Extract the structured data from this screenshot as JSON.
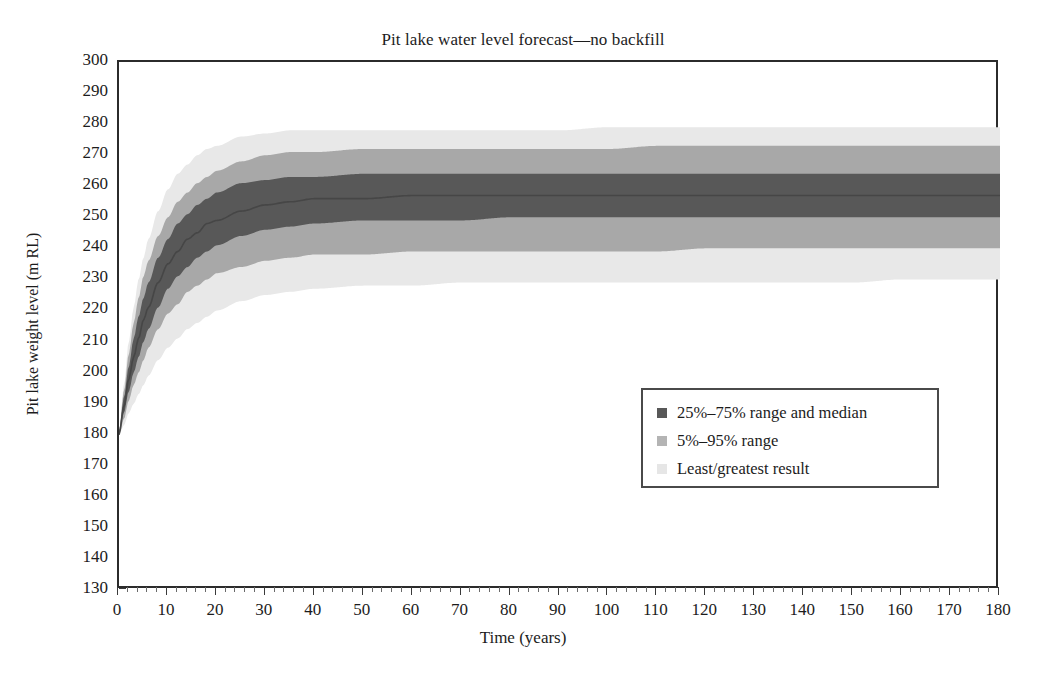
{
  "chart_data": {
    "type": "area",
    "title": "Pit lake water level forecast—no backfill",
    "xlabel": "Time (years)",
    "ylabel": "Pit lake weight level (m RL)",
    "xlim": [
      0,
      180
    ],
    "ylim": [
      130,
      300
    ],
    "x_tick_step": 10,
    "y_tick_step": 10,
    "x_minor_tick_step": 2,
    "y_minor_tick_step": 2,
    "grid": false,
    "legend_position": "center-right inside plot",
    "x_ticks": [
      0,
      10,
      20,
      30,
      40,
      50,
      60,
      70,
      80,
      90,
      100,
      110,
      120,
      130,
      140,
      150,
      160,
      170,
      180
    ],
    "y_ticks": [
      130,
      140,
      150,
      160,
      170,
      180,
      190,
      200,
      210,
      220,
      230,
      240,
      250,
      260,
      270,
      280,
      290,
      300
    ],
    "x": [
      0,
      1,
      2,
      3,
      4,
      5,
      6,
      8,
      10,
      12,
      14,
      16,
      18,
      20,
      25,
      30,
      35,
      40,
      50,
      60,
      70,
      80,
      90,
      100,
      110,
      120,
      130,
      140,
      150,
      160,
      170,
      180
    ],
    "series": [
      {
        "name": "Least/greatest result",
        "role": "outer-band-upper",
        "color": "#e8e8e8",
        "values": [
          181,
          196,
          210,
          221,
          230,
          237,
          243,
          252,
          259,
          264,
          267,
          270,
          272,
          273,
          276,
          277,
          278,
          278,
          278,
          278,
          278,
          278,
          278,
          279,
          279,
          279,
          279,
          279,
          279,
          279,
          279,
          279
        ]
      },
      {
        "name": "Least/greatest result",
        "role": "outer-band-lower",
        "color": "#e8e8e8",
        "values": [
          180,
          183,
          187,
          190,
          193,
          196,
          199,
          204,
          208,
          211,
          214,
          216,
          218,
          220,
          223,
          225,
          226,
          227,
          228,
          228,
          229,
          229,
          229,
          229,
          229,
          229,
          229,
          229,
          229,
          230,
          230,
          230
        ]
      },
      {
        "name": "5%–95% range",
        "role": "inner-band-upper",
        "color": "#a8a8a8",
        "values": [
          181,
          194,
          206,
          216,
          224,
          231,
          236,
          244,
          250,
          255,
          258,
          261,
          263,
          265,
          268,
          270,
          271,
          271,
          272,
          272,
          272,
          272,
          272,
          272,
          273,
          273,
          273,
          273,
          273,
          273,
          273,
          273
        ]
      },
      {
        "name": "5%–95% range",
        "role": "inner-band-lower",
        "color": "#a8a8a8",
        "values": [
          180,
          185,
          191,
          196,
          200,
          204,
          208,
          214,
          219,
          222,
          226,
          228,
          230,
          232,
          234,
          236,
          237,
          238,
          238,
          239,
          239,
          239,
          239,
          239,
          239,
          240,
          240,
          240,
          240,
          240,
          240,
          240
        ]
      },
      {
        "name": "25%–75% range and median",
        "role": "core-band-upper",
        "color": "#585858",
        "values": [
          181,
          192,
          202,
          211,
          218,
          224,
          229,
          237,
          243,
          248,
          251,
          254,
          256,
          258,
          261,
          262,
          263,
          263,
          264,
          264,
          264,
          264,
          264,
          264,
          264,
          264,
          264,
          264,
          264,
          264,
          264,
          264
        ]
      },
      {
        "name": "25%–75% range and median",
        "role": "core-band-lower",
        "color": "#585858",
        "values": [
          180,
          187,
          194,
          200,
          205,
          210,
          214,
          221,
          227,
          231,
          234,
          237,
          239,
          241,
          244,
          246,
          247,
          248,
          249,
          249,
          249,
          250,
          250,
          250,
          250,
          250,
          250,
          250,
          250,
          250,
          250,
          250
        ]
      },
      {
        "name": "Median",
        "role": "median-line",
        "color": "#464646",
        "values": [
          180,
          189,
          198,
          205,
          211,
          217,
          221,
          229,
          235,
          239,
          243,
          245,
          248,
          249,
          252,
          254,
          255,
          256,
          256,
          257,
          257,
          257,
          257,
          257,
          257,
          257,
          257,
          257,
          257,
          257,
          257,
          257
        ]
      }
    ]
  },
  "legend": {
    "items": [
      {
        "label": "25%–75% range and median",
        "color": "#585858"
      },
      {
        "label": "5%–95% range",
        "color": "#b4b4b4"
      },
      {
        "label": "Least/greatest result",
        "color": "#e6e6e6"
      }
    ]
  },
  "colors": {
    "axis": "#2b2b2b",
    "text": "#1c1c1c",
    "band_dark": "#585858",
    "band_mid": "#a8a8a8",
    "band_light": "#e8e8e8",
    "median": "#464646",
    "legend_border": "#4a4a4a",
    "background": "#ffffff"
  }
}
